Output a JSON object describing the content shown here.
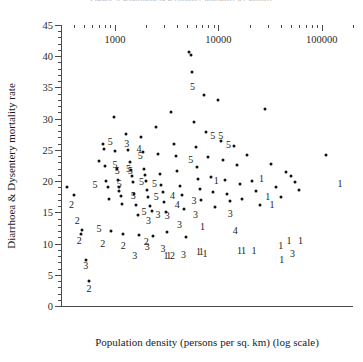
{
  "figure": {
    "clipped_title": "Figure 4. Diarrhoea & Dysentery mortality by density"
  },
  "chart_data": {
    "type": "scatter",
    "title": "",
    "xlabel": "Population density (persons per sq. km) (log scale)",
    "ylabel": "Diarrhoea & Dysentery mortality rate",
    "xscale": "log",
    "yscale": "linear",
    "xlim": [
      300,
      200000
    ],
    "ylim": [
      0,
      45
    ],
    "grid": false,
    "legend": null,
    "y_ticks_major": [
      0,
      5,
      10,
      15,
      20,
      25,
      30,
      35,
      40,
      45
    ],
    "y_tick_minor_step": 1,
    "x_ticks_major": [
      1000,
      10000,
      100000
    ],
    "x_tick_labels": [
      "1000",
      "10000",
      "100000"
    ],
    "x_minor_ticks": [
      400,
      500,
      600,
      700,
      800,
      900,
      2000,
      3000,
      4000,
      5000,
      6000,
      7000,
      8000,
      9000,
      20000,
      30000,
      40000,
      50000,
      60000,
      70000,
      80000,
      90000,
      200000
    ],
    "marker": "dot",
    "marker_color": "#111111",
    "annotation_note": "Selected points are annotated with a single digit group code (1-5) printed beside the marker.",
    "points": [
      {
        "x": 340,
        "y": 19.0
      },
      {
        "x": 400,
        "y": 17.8
      },
      {
        "x": 480,
        "y": 12.2
      },
      {
        "x": 470,
        "y": 11.5
      },
      {
        "x": 520,
        "y": 7.3
      },
      {
        "x": 560,
        "y": 4.0
      },
      {
        "x": 700,
        "y": 23.2
      },
      {
        "x": 760,
        "y": 26.0
      },
      {
        "x": 790,
        "y": 25.2
      },
      {
        "x": 800,
        "y": 22.5
      },
      {
        "x": 820,
        "y": 20.0
      },
      {
        "x": 860,
        "y": 19.0
      },
      {
        "x": 880,
        "y": 17.2
      },
      {
        "x": 910,
        "y": 12.0
      },
      {
        "x": 980,
        "y": 30.2
      },
      {
        "x": 1000,
        "y": 24.8
      },
      {
        "x": 1040,
        "y": 22.0
      },
      {
        "x": 1060,
        "y": 20.2
      },
      {
        "x": 1080,
        "y": 19.0
      },
      {
        "x": 1100,
        "y": 18.4
      },
      {
        "x": 1150,
        "y": 17.6
      },
      {
        "x": 1180,
        "y": 16.4
      },
      {
        "x": 1200,
        "y": 11.6
      },
      {
        "x": 1280,
        "y": 27.6
      },
      {
        "x": 1330,
        "y": 25.0
      },
      {
        "x": 1380,
        "y": 23.0
      },
      {
        "x": 1420,
        "y": 21.8
      },
      {
        "x": 1460,
        "y": 20.8
      },
      {
        "x": 1500,
        "y": 19.8
      },
      {
        "x": 1540,
        "y": 18.0
      },
      {
        "x": 1600,
        "y": 16.2
      },
      {
        "x": 1660,
        "y": 14.6
      },
      {
        "x": 1700,
        "y": 11.4
      },
      {
        "x": 1800,
        "y": 27.0
      },
      {
        "x": 1850,
        "y": 24.6
      },
      {
        "x": 1900,
        "y": 22.0
      },
      {
        "x": 1950,
        "y": 21.0
      },
      {
        "x": 2000,
        "y": 20.0
      },
      {
        "x": 2050,
        "y": 18.6
      },
      {
        "x": 2100,
        "y": 17.4
      },
      {
        "x": 2200,
        "y": 16.0
      },
      {
        "x": 2300,
        "y": 15.2
      },
      {
        "x": 2350,
        "y": 11.2
      },
      {
        "x": 2500,
        "y": 28.6
      },
      {
        "x": 2600,
        "y": 24.4
      },
      {
        "x": 2700,
        "y": 21.2
      },
      {
        "x": 2800,
        "y": 19.4
      },
      {
        "x": 2900,
        "y": 18.2
      },
      {
        "x": 3000,
        "y": 16.6
      },
      {
        "x": 3100,
        "y": 15.0
      },
      {
        "x": 3200,
        "y": 11.8
      },
      {
        "x": 3500,
        "y": 31.0
      },
      {
        "x": 3700,
        "y": 26.0
      },
      {
        "x": 3900,
        "y": 24.0
      },
      {
        "x": 4000,
        "y": 21.6
      },
      {
        "x": 4200,
        "y": 19.2
      },
      {
        "x": 4400,
        "y": 17.8
      },
      {
        "x": 4600,
        "y": 15.6
      },
      {
        "x": 4800,
        "y": 11.0
      },
      {
        "x": 5200,
        "y": 40.6
      },
      {
        "x": 5400,
        "y": 40.2
      },
      {
        "x": 5600,
        "y": 37.4
      },
      {
        "x": 5800,
        "y": 29.4
      },
      {
        "x": 6000,
        "y": 25.4
      },
      {
        "x": 6200,
        "y": 22.2
      },
      {
        "x": 6400,
        "y": 20.4
      },
      {
        "x": 6600,
        "y": 18.8
      },
      {
        "x": 6800,
        "y": 17.0
      },
      {
        "x": 7200,
        "y": 33.8
      },
      {
        "x": 7600,
        "y": 27.8
      },
      {
        "x": 8000,
        "y": 23.8
      },
      {
        "x": 8400,
        "y": 20.6
      },
      {
        "x": 8800,
        "y": 18.2
      },
      {
        "x": 9200,
        "y": 15.8
      },
      {
        "x": 10000,
        "y": 33.0
      },
      {
        "x": 10500,
        "y": 26.4
      },
      {
        "x": 11000,
        "y": 23.4
      },
      {
        "x": 11500,
        "y": 20.2
      },
      {
        "x": 12000,
        "y": 18.0
      },
      {
        "x": 13000,
        "y": 16.8
      },
      {
        "x": 14000,
        "y": 25.6
      },
      {
        "x": 15000,
        "y": 22.6
      },
      {
        "x": 16000,
        "y": 19.6
      },
      {
        "x": 17000,
        "y": 17.2
      },
      {
        "x": 19000,
        "y": 24.2
      },
      {
        "x": 21000,
        "y": 20.0
      },
      {
        "x": 23000,
        "y": 18.4
      },
      {
        "x": 25000,
        "y": 16.2
      },
      {
        "x": 28000,
        "y": 31.6
      },
      {
        "x": 32000,
        "y": 22.8
      },
      {
        "x": 36000,
        "y": 19.0
      },
      {
        "x": 40000,
        "y": 17.4
      },
      {
        "x": 45000,
        "y": 21.4
      },
      {
        "x": 50000,
        "y": 20.8
      },
      {
        "x": 55000,
        "y": 19.8
      },
      {
        "x": 60000,
        "y": 18.6
      },
      {
        "x": 110000,
        "y": 24.2
      }
    ],
    "labels": [
      {
        "x": 380,
        "y": 16.2,
        "text": "2"
      },
      {
        "x": 430,
        "y": 13.6,
        "text": "2"
      },
      {
        "x": 450,
        "y": 10.4,
        "text": "2"
      },
      {
        "x": 520,
        "y": 6.4,
        "text": "3"
      },
      {
        "x": 560,
        "y": 2.8,
        "text": "2"
      },
      {
        "x": 640,
        "y": 19.4,
        "text": "5"
      },
      {
        "x": 700,
        "y": 12.4,
        "text": "5"
      },
      {
        "x": 760,
        "y": 10.0,
        "text": "2"
      },
      {
        "x": 900,
        "y": 26.2,
        "text": "5"
      },
      {
        "x": 1000,
        "y": 22.6,
        "text": "5"
      },
      {
        "x": 1050,
        "y": 21.6,
        "text": "5"
      },
      {
        "x": 1100,
        "y": 19.6,
        "text": "5"
      },
      {
        "x": 1200,
        "y": 9.6,
        "text": "2"
      },
      {
        "x": 1300,
        "y": 26.0,
        "text": "3"
      },
      {
        "x": 1350,
        "y": 22.0,
        "text": "5"
      },
      {
        "x": 1400,
        "y": 21.6,
        "text": "5"
      },
      {
        "x": 1500,
        "y": 17.6,
        "text": "5"
      },
      {
        "x": 1550,
        "y": 8.0,
        "text": "3"
      },
      {
        "x": 1700,
        "y": 25.2,
        "text": "4"
      },
      {
        "x": 1750,
        "y": 24.0,
        "text": "5"
      },
      {
        "x": 1800,
        "y": 19.8,
        "text": "5"
      },
      {
        "x": 1900,
        "y": 15.0,
        "text": "5"
      },
      {
        "x": 2000,
        "y": 10.2,
        "text": "2"
      },
      {
        "x": 2050,
        "y": 9.4,
        "text": "3"
      },
      {
        "x": 2100,
        "y": 13.6,
        "text": "3"
      },
      {
        "x": 2400,
        "y": 19.6,
        "text": "5"
      },
      {
        "x": 2500,
        "y": 17.4,
        "text": "5"
      },
      {
        "x": 2600,
        "y": 14.6,
        "text": "3"
      },
      {
        "x": 2900,
        "y": 9.2,
        "text": "3"
      },
      {
        "x": 3100,
        "y": 8.0,
        "text": "1"
      },
      {
        "x": 3300,
        "y": 8.0,
        "text": "1"
      },
      {
        "x": 3600,
        "y": 8.0,
        "text": "2"
      },
      {
        "x": 3200,
        "y": 14.4,
        "text": "3"
      },
      {
        "x": 3600,
        "y": 17.6,
        "text": "4"
      },
      {
        "x": 4000,
        "y": 16.2,
        "text": "4"
      },
      {
        "x": 4200,
        "y": 13.0,
        "text": "3"
      },
      {
        "x": 4600,
        "y": 8.2,
        "text": "3"
      },
      {
        "x": 5600,
        "y": 35.0,
        "text": "5"
      },
      {
        "x": 5400,
        "y": 23.4,
        "text": "5"
      },
      {
        "x": 5800,
        "y": 16.8,
        "text": "3"
      },
      {
        "x": 6000,
        "y": 14.6,
        "text": "3"
      },
      {
        "x": 6400,
        "y": 8.6,
        "text": "1"
      },
      {
        "x": 6800,
        "y": 8.6,
        "text": "1"
      },
      {
        "x": 7400,
        "y": 8.4,
        "text": "1"
      },
      {
        "x": 7000,
        "y": 12.6,
        "text": "1"
      },
      {
        "x": 8800,
        "y": 27.2,
        "text": "5"
      },
      {
        "x": 10500,
        "y": 27.2,
        "text": "5"
      },
      {
        "x": 12500,
        "y": 25.8,
        "text": "5"
      },
      {
        "x": 9500,
        "y": 20.0,
        "text": "1"
      },
      {
        "x": 13000,
        "y": 14.8,
        "text": "3"
      },
      {
        "x": 14500,
        "y": 12.0,
        "text": "4"
      },
      {
        "x": 16000,
        "y": 8.8,
        "text": "1"
      },
      {
        "x": 17500,
        "y": 8.8,
        "text": "1"
      },
      {
        "x": 22000,
        "y": 8.8,
        "text": "1"
      },
      {
        "x": 26000,
        "y": 20.4,
        "text": "1"
      },
      {
        "x": 30000,
        "y": 17.4,
        "text": "1"
      },
      {
        "x": 33000,
        "y": 16.2,
        "text": "1"
      },
      {
        "x": 40000,
        "y": 9.6,
        "text": "1"
      },
      {
        "x": 41000,
        "y": 7.4,
        "text": "1"
      },
      {
        "x": 48000,
        "y": 10.4,
        "text": "1"
      },
      {
        "x": 52000,
        "y": 8.4,
        "text": "3"
      },
      {
        "x": 62000,
        "y": 10.4,
        "text": "1"
      },
      {
        "x": 150000,
        "y": 19.6,
        "text": "1"
      }
    ]
  }
}
